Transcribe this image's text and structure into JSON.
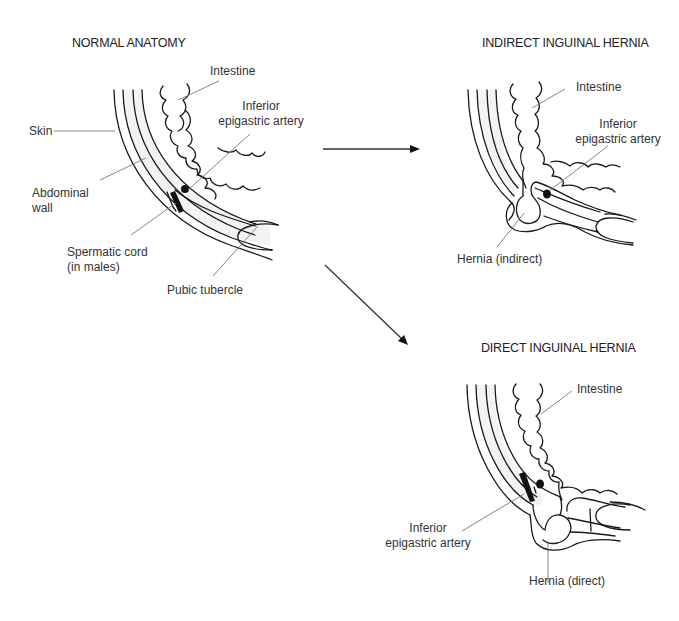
{
  "panels": {
    "normal": {
      "title": "NORMAL ANATOMY",
      "labels": {
        "intestine": "Intestine",
        "artery_line1": "Inferior",
        "artery_line2": "epigastric artery",
        "skin": "Skin",
        "wall_line1": "Abdominal",
        "wall_line2": "wall",
        "cord_line1": "Spermatic cord",
        "cord_line2": "(in males)",
        "pubic": "Pubic tubercle"
      }
    },
    "indirect": {
      "title": "INDIRECT INGUINAL HERNIA",
      "labels": {
        "intestine": "Intestine",
        "artery_line1": "Inferior",
        "artery_line2": "epigastric artery",
        "hernia": "Hernia (indirect)"
      }
    },
    "direct": {
      "title": "DIRECT INGUINAL HERNIA",
      "labels": {
        "intestine": "Intestine",
        "artery_line1": "Inferior",
        "artery_line2": "epigastric artery",
        "hernia": "Hernia (direct)"
      }
    }
  },
  "arrows": [
    {
      "from": "normal",
      "to": "indirect",
      "direction": "right"
    },
    {
      "from": "normal",
      "to": "direct",
      "direction": "down-right"
    }
  ],
  "colors": {
    "line": "#1a1a1a",
    "leader": "#777777",
    "text": "#333333",
    "background": "#ffffff"
  }
}
